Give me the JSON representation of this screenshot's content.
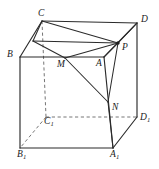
{
  "figure": {
    "shape": "cube",
    "background_color": "#ffffff",
    "solid_edge_color": "#2b2b2b",
    "hidden_edge_color": "#767676",
    "label_color": "#1a1a1a",
    "hidden_edge_style": "dashed"
  },
  "vertices": [
    {
      "id": "C",
      "label": "C",
      "sub": "",
      "x": 42,
      "y": 21,
      "label_x": 38,
      "label_y": 9,
      "hidden": false
    },
    {
      "id": "D",
      "label": "D",
      "sub": "",
      "x": 137,
      "y": 23,
      "label_x": 141,
      "label_y": 15,
      "hidden": false
    },
    {
      "id": "B",
      "label": "B",
      "sub": "",
      "x": 20,
      "y": 57,
      "label_x": 7,
      "label_y": 50,
      "hidden": false
    },
    {
      "id": "A",
      "label": "A",
      "sub": "",
      "x": 104,
      "y": 57,
      "label_x": 96,
      "label_y": 59,
      "hidden": false
    },
    {
      "id": "C1",
      "label": "C",
      "sub": "1",
      "x": 46,
      "y": 117,
      "label_x": 44,
      "label_y": 117,
      "hidden": true
    },
    {
      "id": "D1",
      "label": "D",
      "sub": "1",
      "x": 137,
      "y": 117,
      "label_x": 140,
      "label_y": 113,
      "hidden": false
    },
    {
      "id": "B1",
      "label": "B",
      "sub": "1",
      "x": 20,
      "y": 148,
      "label_x": 17,
      "label_y": 150,
      "hidden": false
    },
    {
      "id": "A1",
      "label": "A",
      "sub": "1",
      "x": 113,
      "y": 148,
      "label_x": 110,
      "label_y": 150,
      "hidden": false
    }
  ],
  "marked_points": [
    {
      "id": "M",
      "label": "M",
      "sub": "",
      "x": 65,
      "y": 58,
      "label_x": 57,
      "label_y": 60,
      "dot": false
    },
    {
      "id": "P",
      "label": "P",
      "sub": "",
      "x": 118,
      "y": 43,
      "label_x": 122,
      "label_y": 43,
      "dot": true
    },
    {
      "id": "N",
      "label": "N",
      "sub": "",
      "x": 108,
      "y": 102,
      "label_x": 112,
      "label_y": 103,
      "dot": false
    },
    {
      "id": "E",
      "label": "",
      "sub": "",
      "x": 33,
      "y": 41,
      "label_x": 0,
      "label_y": 0,
      "dot": false
    }
  ],
  "edges_solid": [
    {
      "name": "edge-C-D",
      "from": "C",
      "to": "D"
    },
    {
      "name": "edge-B-C",
      "from": "B",
      "to": "C"
    },
    {
      "name": "edge-B-A",
      "from": "B",
      "to": "A"
    },
    {
      "name": "edge-A-D",
      "from": "A",
      "to": "D"
    },
    {
      "name": "edge-B-B1",
      "from": "B",
      "to": "B1"
    },
    {
      "name": "edge-A-A1",
      "from": "A",
      "to": "A1"
    },
    {
      "name": "edge-D-D1",
      "from": "D",
      "to": "D1"
    },
    {
      "name": "edge-B1-A1",
      "from": "B1",
      "to": "A1"
    },
    {
      "name": "edge-A1-D1",
      "from": "A1",
      "to": "D1"
    }
  ],
  "edges_hidden": [
    {
      "name": "hidden-edge-C-C1",
      "from": "C",
      "to": "C1"
    },
    {
      "name": "hidden-edge-C1-B1",
      "from": "C1",
      "to": "B1"
    },
    {
      "name": "hidden-edge-C1-D1",
      "from": "C1",
      "to": "D1"
    }
  ],
  "construction_lines": [
    {
      "name": "line-C-E",
      "from": "C",
      "to": "E"
    },
    {
      "name": "line-E-M",
      "from": "E",
      "to": "M"
    },
    {
      "name": "line-E-P",
      "from": "E",
      "to": "P"
    },
    {
      "name": "line-C-P",
      "from": "C",
      "to": "P"
    },
    {
      "name": "line-M-P",
      "from": "M",
      "to": "P"
    },
    {
      "name": "line-M-N",
      "from": "M",
      "to": "N"
    },
    {
      "name": "line-N-P",
      "from": "N",
      "to": "P"
    },
    {
      "name": "line-P-D",
      "from": "P",
      "to": "D"
    },
    {
      "name": "line-P-A",
      "from": "P",
      "to": "A"
    },
    {
      "name": "line-N-A1",
      "from": "N",
      "to": "A1"
    }
  ]
}
